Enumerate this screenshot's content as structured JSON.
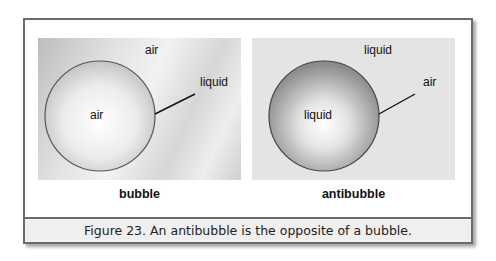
{
  "figure": {
    "caption": "Figure 23. An antibubble is the opposite of a bubble.",
    "panels": [
      {
        "title": "bubble",
        "outside_label": "air",
        "inside_label": "air",
        "pointer_label": "liquid"
      },
      {
        "title": "antibubble",
        "outside_label": "liquid",
        "inside_label": "liquid",
        "pointer_label": "air"
      }
    ]
  }
}
